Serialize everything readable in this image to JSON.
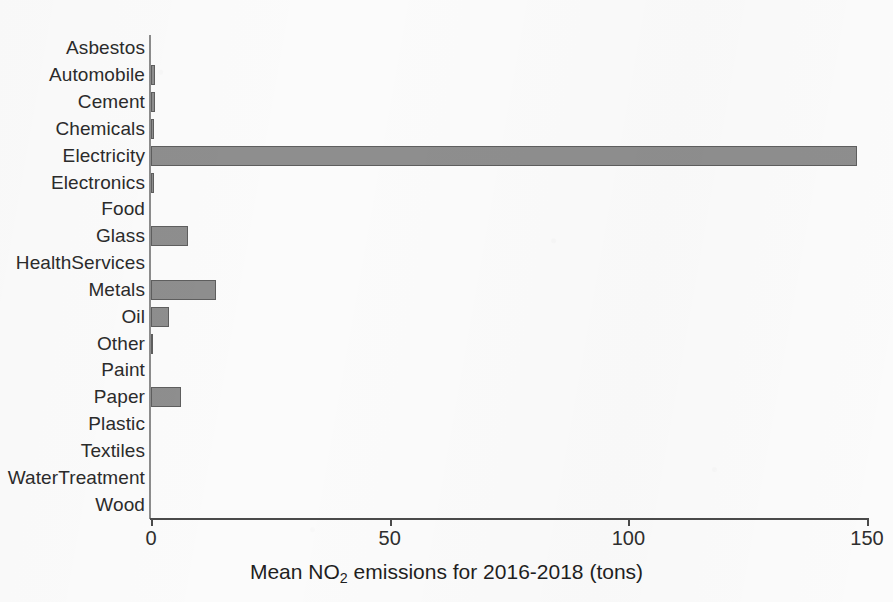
{
  "chart_data": {
    "type": "bar",
    "orientation": "horizontal",
    "title": "",
    "xlabel": "Mean NO2 emissions for 2016-2018 (tons)",
    "xlabel_parts": {
      "before": "Mean NO",
      "sub": "2",
      "after": " emissions for 2016-2018 (tons)"
    },
    "ylabel": "",
    "categories": [
      "Asbestos",
      "Automobile",
      "Cement",
      "Chemicals",
      "Electricity",
      "Electronics",
      "Food",
      "Glass",
      "HealthServices",
      "Metals",
      "Oil",
      "Other",
      "Paint",
      "Paper",
      "Plastic",
      "Textiles",
      "WaterTreatment",
      "Wood"
    ],
    "values": [
      0,
      0.9,
      0.9,
      0.7,
      148,
      0.6,
      0,
      7.8,
      0,
      13.6,
      3.8,
      0.3,
      0,
      6.3,
      0,
      0,
      0,
      0
    ],
    "xlim": [
      0,
      150
    ],
    "xticks": [
      0,
      50,
      100,
      150
    ],
    "xtick_labels": [
      "0",
      "50",
      "100",
      "150"
    ],
    "grid": false,
    "legend": false,
    "bar_color": "#8e8e8e",
    "bar_edge_color": "#5e5e5e",
    "background_color": "#fbfbfb",
    "axis_color": "#4a4a4a"
  }
}
